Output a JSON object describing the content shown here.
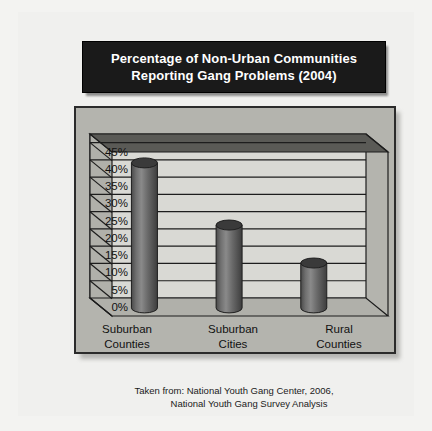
{
  "title": {
    "line1": "Percentage of Non-Urban Communities",
    "line2": "Reporting Gang Problems (2004)"
  },
  "caption": {
    "line1": "Taken from: National Youth Gang Center, 2006,",
    "line2": "National Youth Gang Survey Analysis"
  },
  "colors": {
    "page_background": "#f3f3f1",
    "title_background": "#1a1a1a",
    "title_text": "#ffffff",
    "chart_background": "#b4b4ae",
    "plot_panel": "#d9d9d4",
    "plot_wall": "#b0b0aa",
    "plot_top": "#5a5a56",
    "bar_fill": "#4f4f4f",
    "bar_highlight": "#8a8a8a",
    "bar_top": "#3a3a3a",
    "gridline": "#1d1d1d",
    "frame_border": "#2b2b2b",
    "axis_text": "#111111"
  },
  "chart_data": {
    "type": "bar",
    "title": "Percentage of Non-Urban Communities Reporting Gang Problems (2004)",
    "categories": [
      "Suburban Counties",
      "Suburban Cities",
      "Rural Counties"
    ],
    "category_lines": [
      [
        "Suburban",
        "Counties"
      ],
      [
        "Suburban",
        "Cities"
      ],
      [
        "Rural",
        "Counties"
      ]
    ],
    "values": [
      42,
      24,
      13
    ],
    "xlabel": "",
    "ylabel": "",
    "ylim": [
      0,
      47.5
    ],
    "ytick_values": [
      0,
      5,
      10,
      15,
      20,
      25,
      30,
      35,
      40,
      45
    ],
    "ytick_labels": [
      "0%",
      "5%",
      "10%",
      "15%",
      "20%",
      "25%",
      "30%",
      "35%",
      "40%",
      "45%"
    ],
    "grid": true,
    "legend": "none",
    "style": "3d-cylinder"
  }
}
